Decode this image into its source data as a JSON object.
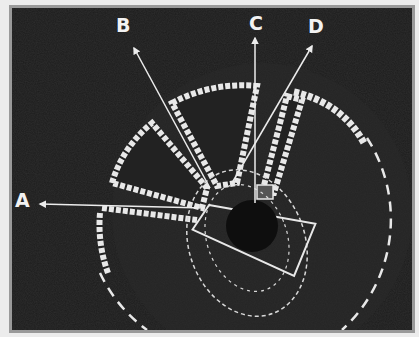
{
  "diagram": {
    "type": "annotated site plan",
    "background_color": "#1c1c1c",
    "line_color": "#e8e8e8",
    "labels": [
      {
        "id": "A",
        "text": "A",
        "x": 15,
        "y": 190,
        "arrow_direction": "left"
      },
      {
        "id": "B",
        "text": "B",
        "x": 115,
        "y": 15,
        "arrow_direction": "up-left"
      },
      {
        "id": "C",
        "text": "C",
        "x": 248,
        "y": 13,
        "arrow_direction": "up"
      },
      {
        "id": "D",
        "text": "D",
        "x": 307,
        "y": 15,
        "arrow_direction": "up-right"
      }
    ],
    "elements": [
      "outer dashed circular enclosure",
      "scalloped sector segments (radiating wedges)",
      "central rectangular structure with dashed subdivisions",
      "dark central circular pit"
    ]
  }
}
